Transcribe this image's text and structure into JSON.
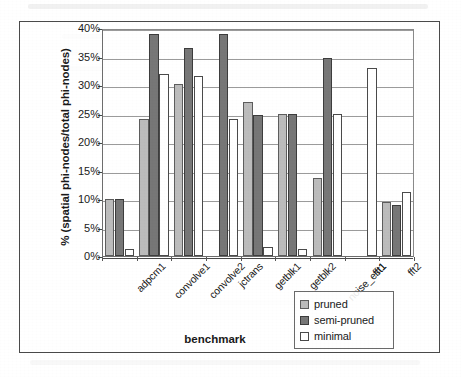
{
  "chart_data": {
    "type": "bar",
    "title": "",
    "xlabel": "benchmark",
    "ylabel": "% (spatial phi-nodes/total phi-nodes)",
    "ylim": [
      0,
      40
    ],
    "ytick_labels": [
      "0%",
      "5%",
      "10%",
      "15%",
      "20%",
      "25%",
      "30%",
      "35%",
      "40%"
    ],
    "ytick_values": [
      0,
      5,
      10,
      15,
      20,
      25,
      30,
      35,
      40
    ],
    "grid": true,
    "legend_position": "bottom-right",
    "categories": [
      "adpcm1",
      "convolve1",
      "convolve2",
      "jctrans",
      "getblk1",
      "getblk2",
      "noise_est1",
      "fft1",
      "fft2"
    ],
    "series": [
      {
        "name": "pruned",
        "color": "#bcbcbc",
        "values": [
          10.0,
          24.0,
          30.2,
          0.0,
          27.0,
          25.0,
          13.7,
          0.0,
          9.5
        ]
      },
      {
        "name": "semi-pruned",
        "color": "#777777",
        "values": [
          10.0,
          39.0,
          36.5,
          39.0,
          24.8,
          25.0,
          34.7,
          0.0,
          9.0
        ]
      },
      {
        "name": "minimal",
        "color": "#ffffff",
        "values": [
          1.3,
          32.0,
          31.5,
          24.0,
          1.6,
          1.2,
          25.0,
          33.0,
          11.3
        ]
      }
    ]
  }
}
